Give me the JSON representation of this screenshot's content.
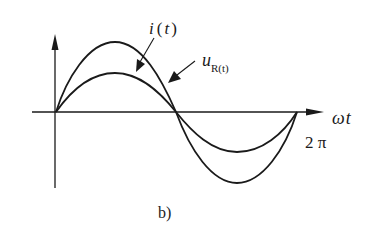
{
  "figure": {
    "caption": "b)",
    "axis": {
      "x_label_omega": "ω",
      "x_label_t": "t",
      "period_label": "2 π"
    },
    "curves": [
      {
        "name": "i(t)",
        "label_main": "i",
        "label_paren_open": "(",
        "label_var": "t",
        "label_paren_close": ")",
        "amplitude": "larger"
      },
      {
        "name": "u_R(t)",
        "label_main": "u",
        "label_sub": "R(t)",
        "amplitude": "smaller"
      }
    ],
    "colors": {
      "stroke": "#1a1a1a",
      "background": "#ffffff"
    }
  }
}
